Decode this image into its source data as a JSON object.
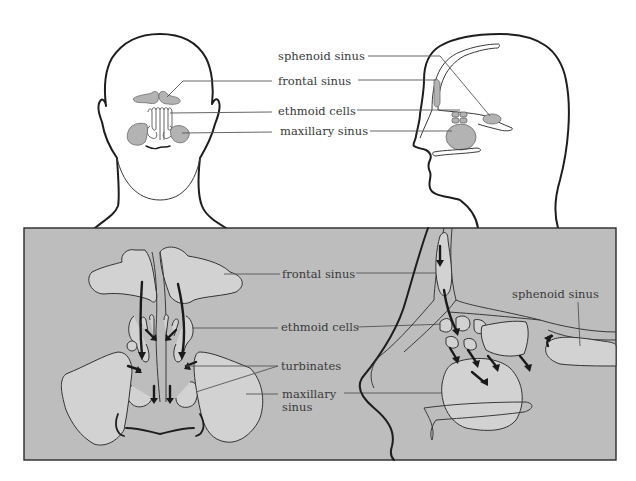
{
  "colors": {
    "background": "#ffffff",
    "panel_fill": "#bdbdbd",
    "panel_border": "#2a2a2a",
    "sinus_fill_top": "#b3b3b3",
    "sinus_fill_panel": "#d2d2d2",
    "outline": "#1e1e1e",
    "text": "#3a3a3a"
  },
  "top_section": {
    "frontal_view": {
      "title": "head-front-view"
    },
    "side_view": {
      "title": "head-side-view"
    },
    "labels": [
      {
        "id": "sphenoid",
        "text": "sphenoid sinus"
      },
      {
        "id": "frontal",
        "text": "frontal sinus"
      },
      {
        "id": "ethmoid",
        "text": "ethmoid cells"
      },
      {
        "id": "maxillary",
        "text": "maxillary sinus"
      }
    ]
  },
  "panel": {
    "left_labels": [
      {
        "id": "frontal",
        "text": "frontal sinus"
      },
      {
        "id": "ethmoid",
        "text": "ethmoid cells"
      },
      {
        "id": "turbinates",
        "text": "turbinates"
      },
      {
        "id": "maxillary",
        "line1": "maxillary",
        "line2": "sinus"
      }
    ],
    "right_labels": [
      {
        "id": "sphenoid",
        "text": "sphenoid sinus"
      }
    ],
    "drainage_arrows": {
      "frontal_view_count": 10,
      "side_view_count": 8
    }
  }
}
